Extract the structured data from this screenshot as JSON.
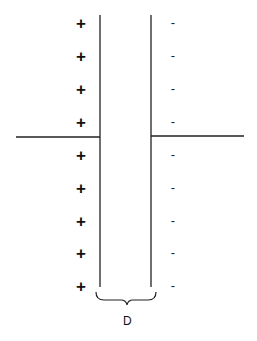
{
  "diagram": {
    "title": "",
    "positive_symbol": "+",
    "negative_symbol": "-",
    "gap_label": "D",
    "charge_rows_y": [
      24,
      57,
      90,
      123,
      156,
      189,
      222,
      254,
      287
    ],
    "plates": [
      {
        "name": "left-plate",
        "x": 100,
        "y1": 15,
        "y2": 287
      },
      {
        "name": "right-plate",
        "x": 151,
        "y1": 15,
        "y2": 287
      }
    ],
    "leads": [
      {
        "name": "left-lead",
        "x1": 16,
        "x2": 100,
        "y": 137
      },
      {
        "name": "right-lead",
        "x1": 151,
        "x2": 244,
        "y": 136
      }
    ],
    "colors": {
      "line": "#222222",
      "background": "#ffffff"
    }
  }
}
